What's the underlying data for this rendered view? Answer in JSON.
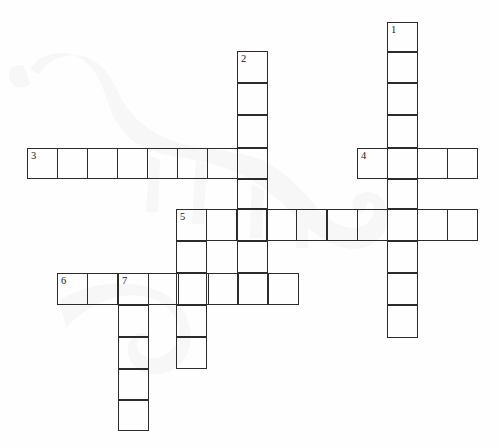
{
  "page": {
    "background_color": "#fefefe",
    "grid_line_color": "#2b2b2b",
    "number_color": "#1a1a1a",
    "watermark": "dinosaur-silhouette"
  },
  "grid": {
    "cell_width": 30.3,
    "cell_height": 31.8,
    "origin_x": 27,
    "origin_y": 22
  },
  "entries": [
    {
      "number": "1",
      "direction": "down",
      "length": 10,
      "start_x": 387,
      "start_y": 22
    },
    {
      "number": "2",
      "direction": "down",
      "length": 8,
      "start_x": 237,
      "start_y": 51
    },
    {
      "number": "3",
      "direction": "across",
      "length": 8,
      "start_x": 27,
      "start_y": 148
    },
    {
      "number": "4",
      "direction": "across",
      "length": 4,
      "start_x": 357,
      "start_y": 148
    },
    {
      "number": "5",
      "direction": "across",
      "length": 10,
      "start_x": 176,
      "start_y": 209
    },
    {
      "number": "5",
      "direction": "down",
      "length": 5,
      "start_x": 176,
      "start_y": 209
    },
    {
      "number": "6",
      "direction": "across",
      "length": 8,
      "start_x": 57,
      "start_y": 273
    },
    {
      "number": "7",
      "direction": "down",
      "length": 5,
      "start_x": 118,
      "start_y": 273
    }
  ],
  "cells": [
    {
      "name": "cell-c1-r1",
      "x": 387,
      "y": 22,
      "w": 31,
      "h": 30,
      "number": "1"
    },
    {
      "name": "cell-c1-r2",
      "x": 387,
      "y": 52,
      "w": 31,
      "h": 31,
      "number": ""
    },
    {
      "name": "cell-c1-r3",
      "x": 387,
      "y": 83,
      "w": 31,
      "h": 32,
      "number": ""
    },
    {
      "name": "cell-c1-r4",
      "x": 387,
      "y": 115,
      "w": 31,
      "h": 33,
      "number": ""
    },
    {
      "name": "cell-c1-r5",
      "x": 387,
      "y": 148,
      "w": 31,
      "h": 31,
      "number": ""
    },
    {
      "name": "cell-c1-r6",
      "x": 387,
      "y": 179,
      "w": 31,
      "h": 30,
      "number": ""
    },
    {
      "name": "cell-c1-r7",
      "x": 387,
      "y": 209,
      "w": 31,
      "h": 32,
      "number": ""
    },
    {
      "name": "cell-c1-r8",
      "x": 387,
      "y": 241,
      "w": 31,
      "h": 32,
      "number": ""
    },
    {
      "name": "cell-c1-r9",
      "x": 387,
      "y": 273,
      "w": 31,
      "h": 32,
      "number": ""
    },
    {
      "name": "cell-c1-r10",
      "x": 387,
      "y": 305,
      "w": 31,
      "h": 33,
      "number": ""
    },
    {
      "name": "cell-c2-r1",
      "x": 237,
      "y": 51,
      "w": 31,
      "h": 32,
      "number": "2"
    },
    {
      "name": "cell-c2-r2",
      "x": 237,
      "y": 83,
      "w": 31,
      "h": 32,
      "number": ""
    },
    {
      "name": "cell-c2-r3",
      "x": 237,
      "y": 115,
      "w": 31,
      "h": 33,
      "number": ""
    },
    {
      "name": "cell-c2-r4",
      "x": 237,
      "y": 148,
      "w": 31,
      "h": 31,
      "number": ""
    },
    {
      "name": "cell-c2-r5",
      "x": 237,
      "y": 179,
      "w": 31,
      "h": 30,
      "number": ""
    },
    {
      "name": "cell-c2-r6",
      "x": 237,
      "y": 209,
      "w": 31,
      "h": 32,
      "number": ""
    },
    {
      "name": "cell-c2-r7",
      "x": 237,
      "y": 241,
      "w": 31,
      "h": 32,
      "number": ""
    },
    {
      "name": "cell-c2-r8",
      "x": 237,
      "y": 273,
      "w": 31,
      "h": 32,
      "number": ""
    },
    {
      "name": "cell-a3-1",
      "x": 27,
      "y": 148,
      "w": 31,
      "h": 31,
      "number": "3"
    },
    {
      "name": "cell-a3-2",
      "x": 57,
      "y": 148,
      "w": 31,
      "h": 31,
      "number": ""
    },
    {
      "name": "cell-a3-3",
      "x": 87,
      "y": 148,
      "w": 31,
      "h": 31,
      "number": ""
    },
    {
      "name": "cell-a3-4",
      "x": 117,
      "y": 148,
      "w": 31,
      "h": 31,
      "number": ""
    },
    {
      "name": "cell-a3-5",
      "x": 147,
      "y": 148,
      "w": 31,
      "h": 31,
      "number": ""
    },
    {
      "name": "cell-a3-6",
      "x": 177,
      "y": 148,
      "w": 31,
      "h": 31,
      "number": ""
    },
    {
      "name": "cell-a3-7",
      "x": 207,
      "y": 148,
      "w": 31,
      "h": 31,
      "number": ""
    },
    {
      "name": "cell-a3-8",
      "x": 237,
      "y": 148,
      "w": 31,
      "h": 31,
      "number": ""
    },
    {
      "name": "cell-a4-1",
      "x": 357,
      "y": 148,
      "w": 31,
      "h": 31,
      "number": "4"
    },
    {
      "name": "cell-a4-2",
      "x": 387,
      "y": 148,
      "w": 31,
      "h": 31,
      "number": ""
    },
    {
      "name": "cell-a4-3",
      "x": 417,
      "y": 148,
      "w": 31,
      "h": 31,
      "number": ""
    },
    {
      "name": "cell-a4-4",
      "x": 447,
      "y": 148,
      "w": 31,
      "h": 31,
      "number": ""
    },
    {
      "name": "cell-a5-1",
      "x": 176,
      "y": 209,
      "w": 31,
      "h": 32,
      "number": "5"
    },
    {
      "name": "cell-a5-2",
      "x": 206,
      "y": 209,
      "w": 31,
      "h": 32,
      "number": ""
    },
    {
      "name": "cell-a5-3",
      "x": 236,
      "y": 209,
      "w": 31,
      "h": 32,
      "number": ""
    },
    {
      "name": "cell-a5-4",
      "x": 266,
      "y": 209,
      "w": 31,
      "h": 32,
      "number": ""
    },
    {
      "name": "cell-a5-5",
      "x": 296,
      "y": 209,
      "w": 31,
      "h": 32,
      "number": ""
    },
    {
      "name": "cell-a5-6",
      "x": 327,
      "y": 209,
      "w": 31,
      "h": 32,
      "number": ""
    },
    {
      "name": "cell-a5-7",
      "x": 357,
      "y": 209,
      "w": 31,
      "h": 32,
      "number": ""
    },
    {
      "name": "cell-a5-8",
      "x": 387,
      "y": 209,
      "w": 31,
      "h": 32,
      "number": ""
    },
    {
      "name": "cell-a5-9",
      "x": 417,
      "y": 209,
      "w": 31,
      "h": 32,
      "number": ""
    },
    {
      "name": "cell-a5-10",
      "x": 447,
      "y": 209,
      "w": 31,
      "h": 32,
      "number": ""
    },
    {
      "name": "cell-c5-r2",
      "x": 176,
      "y": 241,
      "w": 31,
      "h": 32,
      "number": ""
    },
    {
      "name": "cell-c5-r3",
      "x": 176,
      "y": 273,
      "w": 31,
      "h": 32,
      "number": ""
    },
    {
      "name": "cell-c5-r4",
      "x": 176,
      "y": 305,
      "w": 31,
      "h": 32,
      "number": ""
    },
    {
      "name": "cell-c5-r5",
      "x": 176,
      "y": 337,
      "w": 31,
      "h": 32,
      "number": ""
    },
    {
      "name": "cell-a6-1",
      "x": 57,
      "y": 273,
      "w": 31,
      "h": 32,
      "number": "6"
    },
    {
      "name": "cell-a6-2",
      "x": 87,
      "y": 273,
      "w": 31,
      "h": 32,
      "number": ""
    },
    {
      "name": "cell-a6-3",
      "x": 118,
      "y": 273,
      "w": 31,
      "h": 32,
      "number": "7"
    },
    {
      "name": "cell-a6-4",
      "x": 148,
      "y": 273,
      "w": 31,
      "h": 32,
      "number": ""
    },
    {
      "name": "cell-a6-5",
      "x": 178,
      "y": 273,
      "w": 31,
      "h": 32,
      "number": ""
    },
    {
      "name": "cell-a6-6",
      "x": 208,
      "y": 273,
      "w": 31,
      "h": 32,
      "number": ""
    },
    {
      "name": "cell-a6-7",
      "x": 238,
      "y": 273,
      "w": 31,
      "h": 32,
      "number": ""
    },
    {
      "name": "cell-a6-8",
      "x": 268,
      "y": 273,
      "w": 31,
      "h": 32,
      "number": ""
    },
    {
      "name": "cell-c7-r2",
      "x": 118,
      "y": 305,
      "w": 31,
      "h": 32,
      "number": ""
    },
    {
      "name": "cell-c7-r3",
      "x": 118,
      "y": 337,
      "w": 31,
      "h": 32,
      "number": ""
    },
    {
      "name": "cell-c7-r4",
      "x": 118,
      "y": 369,
      "w": 31,
      "h": 31,
      "number": ""
    },
    {
      "name": "cell-c7-r5",
      "x": 118,
      "y": 400,
      "w": 31,
      "h": 31,
      "number": ""
    }
  ]
}
